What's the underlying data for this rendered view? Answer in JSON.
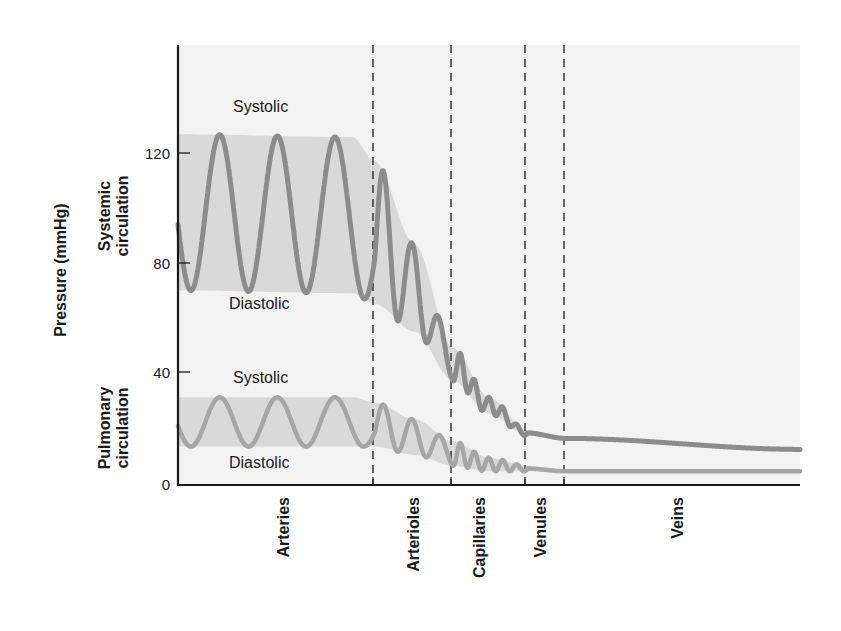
{
  "chart_data": {
    "type": "line",
    "title": "",
    "xlabel": "",
    "ylabel": "Pressure (mmHg)",
    "ylim": [
      0,
      160
    ],
    "yticks": [
      0,
      40,
      80,
      120
    ],
    "grid": false,
    "regions": [
      {
        "name": "Arteries",
        "x_start": 0,
        "x_end": 0.317
      },
      {
        "name": "Arterioles",
        "x_start": 0.317,
        "x_end": 0.442
      },
      {
        "name": "Capillaries",
        "x_start": 0.442,
        "x_end": 0.561
      },
      {
        "name": "Venules",
        "x_start": 0.561,
        "x_end": 0.624
      },
      {
        "name": "Veins",
        "x_start": 0.624,
        "x_end": 1.0
      }
    ],
    "series": [
      {
        "name": "Systemic circulation",
        "systolic_label": "Systolic",
        "diastolic_label": "Diastolic",
        "envelope": {
          "x": [
            0,
            0.28,
            0.317,
            0.38,
            0.442,
            0.5,
            0.561,
            0.624,
            1.0
          ],
          "systolic": [
            128,
            127,
            118,
            88,
            50,
            32,
            20,
            17,
            13
          ],
          "diastolic": [
            71,
            70,
            66,
            56,
            38,
            26,
            18,
            17,
            13
          ]
        },
        "notable_points": [
          {
            "region": "Arteries",
            "peak": 128,
            "trough": 70
          },
          {
            "region": "Arterioles",
            "peak": 93,
            "trough": 66
          },
          {
            "region": "Capillaries",
            "start": 40,
            "end": 20
          },
          {
            "region": "Veins",
            "end": 13
          }
        ]
      },
      {
        "name": "Pulmonary circulation",
        "systolic_label": "Systolic",
        "diastolic_label": "Diastolic",
        "envelope": {
          "x": [
            0,
            0.28,
            0.317,
            0.38,
            0.442,
            0.5,
            0.561,
            0.624,
            1.0
          ],
          "systolic": [
            32,
            32,
            30,
            24,
            16,
            10,
            7,
            5,
            5
          ],
          "diastolic": [
            14,
            14,
            14,
            11,
            7,
            5,
            5,
            5,
            5
          ]
        },
        "notable_points": [
          {
            "region": "Arteries",
            "peak": 32,
            "trough": 14
          },
          {
            "region": "Veins",
            "end": 5
          }
        ]
      }
    ]
  },
  "labels": {
    "y_axis_title": "Pressure (mmHg)",
    "systemic_line1": "Systemic",
    "systemic_line2": "circulation",
    "pulmonary_line1": "Pulmonary",
    "pulmonary_line2": "circulation",
    "sys_systolic": "Systolic",
    "sys_diastolic": "Diastolic",
    "pul_systolic": "Systolic",
    "pul_diastolic": "Diastolic",
    "ticks": [
      "0",
      "40",
      "80",
      "120"
    ],
    "regions": [
      "Arteries",
      "Arterioles",
      "Capillaries",
      "Venules",
      "Veins"
    ]
  },
  "colors": {
    "band": "#d9d9d9",
    "plot_bg": "#f3f3f3",
    "systemic_line": "#8c8c8c",
    "pulmonary_line": "#a6a6a6",
    "axis": "#1a1a1a"
  }
}
